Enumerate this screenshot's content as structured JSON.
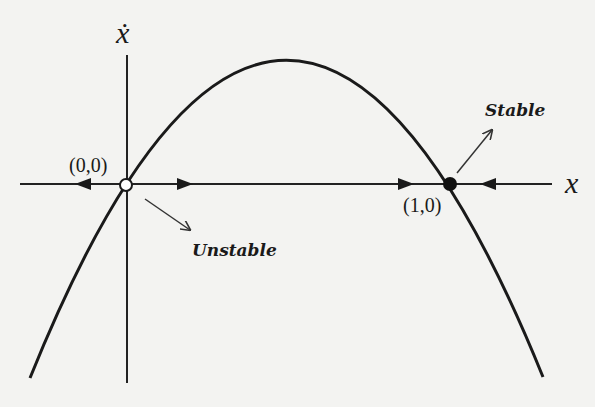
{
  "diagram": {
    "x_axis_label": "x",
    "y_axis_label": "ẋ",
    "fixed_points": [
      {
        "label": "(0,0)",
        "stability": "Unstable",
        "marker": "open-circle"
      },
      {
        "label": "(1,0)",
        "stability": "Stable",
        "marker": "filled-circle"
      }
    ],
    "annotations": {
      "unstable": "Unstable",
      "stable": "Stable"
    },
    "colors": {
      "line": "#1a1a1a",
      "background": "#f3f3f1"
    }
  }
}
